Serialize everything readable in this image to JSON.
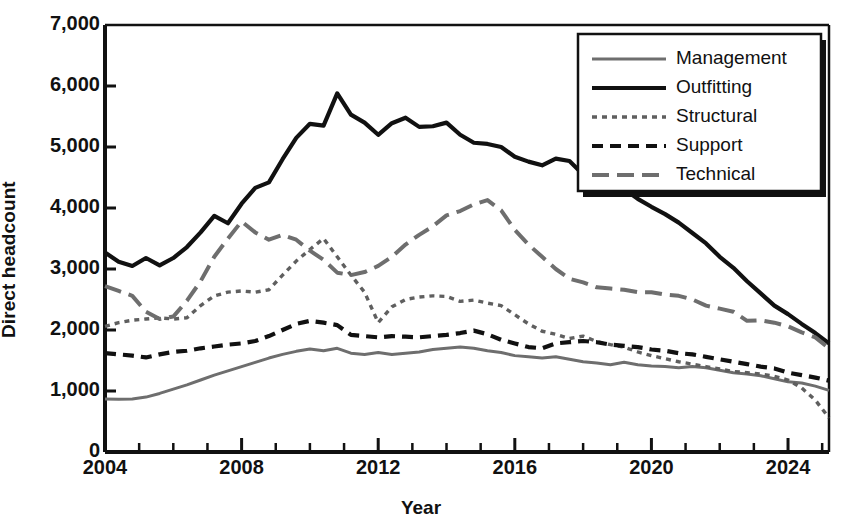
{
  "chart_data": {
    "type": "line",
    "title": "",
    "xlabel": "Year",
    "ylabel": "Direct headcount",
    "xlim": [
      2004,
      2025.2
    ],
    "ylim": [
      0,
      7000
    ],
    "ytick_labels": [
      "0",
      "1,000",
      "2,000",
      "3,000",
      "4,000",
      "5,000",
      "6,000",
      "7,000"
    ],
    "ytick_values": [
      0,
      1000,
      2000,
      3000,
      4000,
      5000,
      6000,
      7000
    ],
    "xtick_labels": [
      "2004",
      "2008",
      "2012",
      "2016",
      "2020",
      "2024"
    ],
    "xtick_values": [
      2004,
      2008,
      2012,
      2016,
      2020,
      2024
    ],
    "xtick_minor_values": [
      2005,
      2006,
      2007,
      2009,
      2010,
      2011,
      2013,
      2014,
      2015,
      2017,
      2018,
      2019,
      2021,
      2022,
      2023,
      2025
    ],
    "grid": false,
    "legend_position": "top-right",
    "x": [
      2004,
      2004.4,
      2004.8,
      2005.2,
      2005.6,
      2006,
      2006.4,
      2006.8,
      2007.2,
      2007.6,
      2008,
      2008.4,
      2008.8,
      2009.2,
      2009.6,
      2010,
      2010.4,
      2010.8,
      2011.2,
      2011.6,
      2012,
      2012.4,
      2012.8,
      2013.2,
      2013.6,
      2014,
      2014.4,
      2014.8,
      2015.2,
      2015.6,
      2016,
      2016.4,
      2016.8,
      2017.2,
      2017.6,
      2018,
      2018.4,
      2018.8,
      2019.2,
      2019.6,
      2020,
      2020.4,
      2020.8,
      2021.2,
      2021.6,
      2022,
      2022.4,
      2022.8,
      2023.2,
      2023.6,
      2024,
      2024.4,
      2024.8,
      2025.2
    ],
    "series": [
      {
        "name": "Management",
        "style": "solid-thin-gray",
        "color": "#6e6e6e",
        "values": [
          870,
          865,
          870,
          900,
          960,
          1030,
          1100,
          1180,
          1260,
          1330,
          1400,
          1470,
          1540,
          1600,
          1650,
          1690,
          1660,
          1700,
          1620,
          1600,
          1630,
          1600,
          1620,
          1640,
          1680,
          1700,
          1720,
          1700,
          1660,
          1630,
          1580,
          1560,
          1540,
          1560,
          1520,
          1480,
          1460,
          1430,
          1470,
          1430,
          1410,
          1400,
          1380,
          1400,
          1380,
          1340,
          1300,
          1280,
          1250,
          1200,
          1150,
          1130,
          1080,
          1010
        ]
      },
      {
        "name": "Outfitting",
        "style": "solid-thick-black",
        "color": "#111111",
        "values": [
          3270,
          3120,
          3050,
          3180,
          3060,
          3180,
          3360,
          3600,
          3870,
          3750,
          4070,
          4330,
          4420,
          4800,
          5150,
          5380,
          5350,
          5880,
          5530,
          5400,
          5200,
          5390,
          5480,
          5330,
          5340,
          5400,
          5200,
          5070,
          5050,
          5000,
          4840,
          4760,
          4700,
          4810,
          4770,
          4550,
          4540,
          4480,
          4310,
          4150,
          4020,
          3900,
          3760,
          3590,
          3420,
          3200,
          3020,
          2800,
          2600,
          2400,
          2260,
          2100,
          1950,
          1780
        ]
      },
      {
        "name": "Structural",
        "style": "dotted-gray",
        "color": "#5f5f5f",
        "values": [
          2060,
          2120,
          2160,
          2180,
          2200,
          2180,
          2200,
          2400,
          2560,
          2620,
          2640,
          2620,
          2660,
          2900,
          3130,
          3320,
          3500,
          3200,
          2900,
          2620,
          2120,
          2380,
          2500,
          2540,
          2560,
          2550,
          2470,
          2490,
          2440,
          2400,
          2250,
          2100,
          1980,
          1930,
          1860,
          1900,
          1810,
          1760,
          1720,
          1640,
          1580,
          1530,
          1480,
          1440,
          1400,
          1360,
          1320,
          1300,
          1280,
          1240,
          1180,
          1050,
          850,
          560
        ]
      },
      {
        "name": "Support",
        "style": "dashed-black",
        "color": "#111111",
        "values": [
          1620,
          1600,
          1580,
          1550,
          1600,
          1640,
          1660,
          1700,
          1730,
          1760,
          1780,
          1820,
          1900,
          2000,
          2100,
          2150,
          2120,
          2080,
          1920,
          1900,
          1880,
          1900,
          1890,
          1880,
          1900,
          1920,
          1950,
          1990,
          1930,
          1840,
          1780,
          1720,
          1700,
          1780,
          1800,
          1820,
          1800,
          1760,
          1740,
          1720,
          1680,
          1660,
          1620,
          1600,
          1560,
          1520,
          1480,
          1440,
          1400,
          1370,
          1300,
          1260,
          1220,
          1170
        ]
      },
      {
        "name": "Technical",
        "style": "longdash-gray",
        "color": "#6e6e6e",
        "values": [
          2720,
          2640,
          2560,
          2300,
          2180,
          2220,
          2480,
          2800,
          3200,
          3500,
          3780,
          3600,
          3480,
          3560,
          3480,
          3300,
          3150,
          2940,
          2900,
          2950,
          3050,
          3200,
          3400,
          3560,
          3700,
          3880,
          3950,
          4060,
          4130,
          3960,
          3640,
          3400,
          3200,
          3000,
          2840,
          2780,
          2700,
          2680,
          2660,
          2620,
          2620,
          2580,
          2560,
          2500,
          2400,
          2350,
          2300,
          2150,
          2160,
          2120,
          2060,
          1960,
          1880,
          1700
        ]
      }
    ]
  },
  "legend": {
    "items": [
      {
        "label": "Management"
      },
      {
        "label": "Outfitting"
      },
      {
        "label": "Structural"
      },
      {
        "label": "Support"
      },
      {
        "label": "Technical"
      }
    ]
  }
}
